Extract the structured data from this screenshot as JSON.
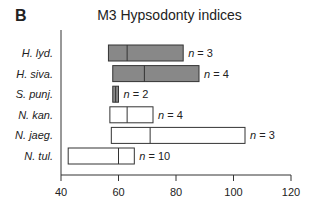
{
  "panel_label": "B",
  "chart_data": {
    "type": "box",
    "title": "M3 Hypsodonty indices",
    "xlabel": "",
    "ylabel": "",
    "xlim": [
      40,
      120
    ],
    "xticks": [
      40,
      60,
      80,
      100,
      120
    ],
    "grid": false,
    "legend": "none",
    "colors": {
      "filled": "#888888",
      "open": "#ffffff",
      "stroke": "#333333"
    },
    "series": [
      {
        "name": "H. lyd.",
        "min": 56.5,
        "median": 63,
        "max": 82.5,
        "n_label": "n = 3",
        "filled": true
      },
      {
        "name": "H. siva.",
        "min": 58,
        "median": 69,
        "max": 88,
        "n_label": "n = 4",
        "filled": true
      },
      {
        "name": "S. punj.",
        "min": 58,
        "median": 59,
        "max": 60,
        "n_label": "n = 2",
        "filled": true
      },
      {
        "name": "N. kan.",
        "min": 57,
        "median": 63,
        "max": 72,
        "n_label": "n = 4",
        "filled": false
      },
      {
        "name": "N. jaeg.",
        "min": 57.5,
        "median": 71,
        "max": 104,
        "n_label": "n = 3",
        "filled": false
      },
      {
        "name": "N. tul.",
        "min": 42.5,
        "median": 60,
        "max": 65.5,
        "n_label": "n = 10",
        "filled": false
      }
    ]
  }
}
